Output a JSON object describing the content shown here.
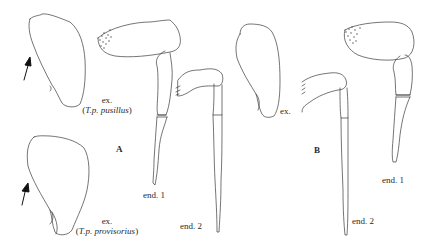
{
  "figure": {
    "panels": [
      {
        "id": "A",
        "label": "A",
        "exopods": [
          {
            "label": "ex.",
            "taxon": "T.p. pusillus",
            "open": "(",
            "close": ")"
          },
          {
            "label": "ex.",
            "taxon": "T.p. provisorius",
            "open": "(",
            "close": ")"
          }
        ],
        "endopods": [
          {
            "label": "end. 1"
          },
          {
            "label": "end. 2"
          }
        ]
      },
      {
        "id": "B",
        "label": "B",
        "exopods": [
          {
            "label": "ex."
          }
        ],
        "endopods": [
          {
            "label": "end. 1"
          },
          {
            "label": "end. 2"
          }
        ]
      }
    ],
    "icons": [
      "arrow-icon",
      "arrow-icon"
    ],
    "colors": {
      "line": "#3a3a3a",
      "arrow": "#111111",
      "background": "#ffffff"
    }
  }
}
